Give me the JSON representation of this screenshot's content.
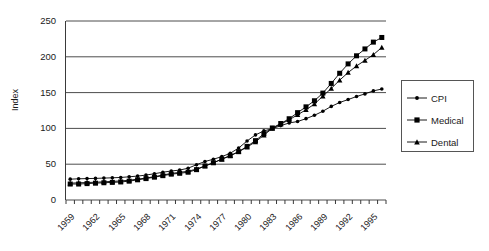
{
  "chart_data": {
    "type": "line",
    "title": "",
    "xlabel": "",
    "ylabel": "Index",
    "ylim": [
      0,
      250
    ],
    "ytick_values": [
      250,
      200,
      150,
      100,
      50,
      0
    ],
    "ytick_labels": [
      "250",
      "200",
      "150",
      "100",
      "50",
      "0"
    ],
    "grid": "horizontal",
    "legend_position": "right",
    "x": [
      1959,
      1960,
      1961,
      1962,
      1963,
      1964,
      1965,
      1966,
      1967,
      1968,
      1969,
      1970,
      1971,
      1972,
      1973,
      1974,
      1975,
      1976,
      1977,
      1978,
      1979,
      1980,
      1981,
      1982,
      1983,
      1984,
      1985,
      1986,
      1987,
      1988,
      1989,
      1990,
      1991,
      1992,
      1993,
      1994,
      1995,
      1996
    ],
    "xtick_labels": [
      "1959",
      "1962",
      "1965",
      "1968",
      "1971",
      "1974",
      "1977",
      "1980",
      "1983",
      "1986",
      "1989",
      "1992",
      "1995"
    ],
    "series": [
      {
        "name": "CPI",
        "marker": "diamond",
        "color": "#000000",
        "values": [
          29.1,
          29.6,
          29.9,
          30.2,
          30.6,
          31.0,
          31.5,
          32.4,
          33.4,
          34.8,
          36.7,
          38.8,
          40.5,
          41.8,
          44.4,
          49.3,
          53.8,
          56.9,
          60.6,
          65.2,
          72.6,
          82.4,
          90.9,
          96.5,
          99.6,
          103.9,
          107.6,
          109.6,
          113.6,
          118.3,
          124.0,
          130.7,
          136.2,
          140.3,
          144.5,
          148.2,
          152.4,
          155.0
        ]
      },
      {
        "name": "Medical",
        "marker": "square",
        "color": "#000000",
        "values": [
          22.3,
          22.3,
          22.9,
          23.5,
          24.1,
          24.6,
          25.2,
          26.3,
          28.2,
          29.9,
          31.9,
          34.0,
          36.1,
          37.3,
          38.8,
          42.4,
          47.5,
          52.0,
          57.0,
          61.8,
          67.5,
          74.9,
          82.9,
          92.5,
          100.6,
          106.8,
          113.5,
          122.0,
          130.1,
          138.6,
          149.3,
          162.8,
          177.0,
          190.1,
          201.4,
          211.0,
          220.5,
          227.0
        ]
      },
      {
        "name": "Dental",
        "marker": "triangle",
        "color": "#000000",
        "values": [
          23.5,
          24.0,
          24.4,
          24.8,
          25.4,
          26.0,
          26.6,
          27.6,
          29.1,
          30.7,
          32.6,
          34.9,
          37.1,
          38.6,
          40.2,
          43.2,
          47.5,
          52.0,
          57.0,
          62.0,
          67.4,
          73.9,
          81.2,
          90.6,
          100.0,
          106.0,
          112.0,
          119.0,
          126.0,
          134.0,
          145.0,
          155.8,
          167.4,
          178.0,
          187.2,
          195.0,
          203.0,
          213.0
        ]
      }
    ]
  },
  "legend": {
    "items": [
      {
        "label": "CPI"
      },
      {
        "label": "Medical"
      },
      {
        "label": "Dental"
      }
    ]
  }
}
